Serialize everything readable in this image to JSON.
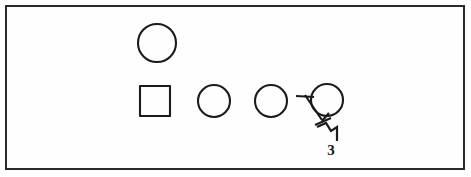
{
  "figure": {
    "frame": {
      "x": 5,
      "y": 5,
      "width": 460,
      "height": 165,
      "stroke_color": "#2b2b2b",
      "background_color": "#fefefe"
    },
    "canvas": {
      "width": 471,
      "height": 177,
      "background_color": "#ffffff"
    },
    "stroke_color": "#1b1b1b",
    "shapes": [
      {
        "id": "circle-top",
        "name": "circle-top",
        "type": "circle",
        "cx": 157,
        "cy": 43,
        "r": 19,
        "row": "top"
      },
      {
        "id": "square-1",
        "name": "square",
        "type": "square",
        "x": 140,
        "y": 86,
        "width": 30,
        "height": 30,
        "row": "bottom"
      },
      {
        "id": "circle-2",
        "name": "circle-second",
        "type": "circle",
        "cx": 214,
        "cy": 101,
        "r": 16,
        "row": "bottom"
      },
      {
        "id": "circle-3",
        "name": "circle-third",
        "type": "circle",
        "cx": 271,
        "cy": 101,
        "r": 16,
        "row": "bottom"
      },
      {
        "id": "circle-4",
        "name": "circle-labeled",
        "type": "circle",
        "cx": 327,
        "cy": 100,
        "r": 16,
        "row": "bottom",
        "label": "3"
      }
    ],
    "annotation": {
      "reference_numeral": "3",
      "label_x": 331,
      "label_y": 153,
      "target_shape": "circle-labeled",
      "leader_stub": "horizontal tick entering from the left at the circle",
      "leader_path": "diagonal leader with zigzag jog descending to the numeral"
    }
  }
}
